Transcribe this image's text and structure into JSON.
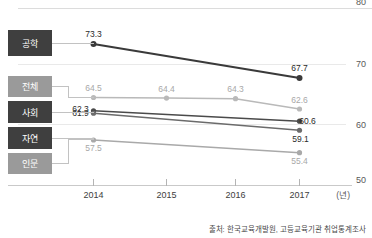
{
  "chart_data": {
    "type": "line",
    "title": "",
    "xlabel": "(년)",
    "ylabel": "",
    "x": [
      "2014",
      "2015",
      "2016",
      "2017"
    ],
    "categories": [
      "2014",
      "2015",
      "2016",
      "2017"
    ],
    "ylim": [
      50,
      80
    ],
    "yticks": [
      "80",
      "70",
      "60",
      "50"
    ],
    "grid": true,
    "legend_position": "left-callout",
    "series": [
      {
        "name": "공학",
        "color": "#3a3a3a",
        "values": [
          73.3,
          null,
          null,
          67.7
        ],
        "shown_labels": [
          "73.3",
          "",
          "",
          "67.7"
        ],
        "label_color": "#2b2b2b",
        "box_color": "#3f3f3f"
      },
      {
        "name": "전체",
        "color": "#b9b9b9",
        "values": [
          64.5,
          64.4,
          64.3,
          62.6
        ],
        "shown_labels": [
          "64.5",
          "64.4",
          "64.3",
          "62.6"
        ],
        "label_color": "#a8a8a8",
        "box_color": "#9a9a9a"
      },
      {
        "name": "사회",
        "color": "#4a4a4a",
        "values": [
          62.3,
          null,
          null,
          60.6
        ],
        "shown_labels": [
          "62.3",
          "",
          "",
          "60.6"
        ],
        "label_color": "#2b2b2b",
        "box_color": "#3f3f3f"
      },
      {
        "name": "자연",
        "color": "#6b6b6b",
        "values": [
          61.9,
          null,
          null,
          59.1
        ],
        "shown_labels": [
          "61.9",
          "",
          "",
          "59.1"
        ],
        "label_color": "#2b2b2b",
        "box_color": "#3f3f3f"
      },
      {
        "name": "인문",
        "color": "#a9a9a9",
        "values": [
          57.5,
          null,
          null,
          55.4
        ],
        "shown_labels": [
          "57.5",
          "",
          "",
          "55.4"
        ],
        "label_color": "#a8a8a8",
        "box_color": "#9a9a9a"
      }
    ],
    "source_note": "출처: 한국교육개발원, 고등교육기관 취업통계조사"
  }
}
